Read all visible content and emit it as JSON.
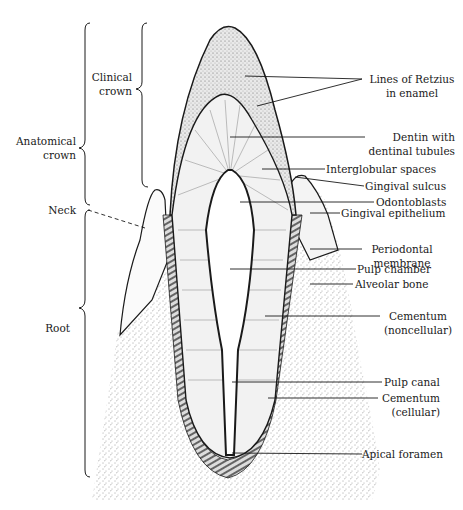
{
  "diagram": {
    "left_labels": {
      "clinical_crown": [
        "Clinical",
        "crown"
      ],
      "anatomical_crown": [
        "Anatomical",
        "crown"
      ],
      "neck": "Neck",
      "root": "Root"
    },
    "right_labels": [
      {
        "id": "lines-of-retzius",
        "lines": [
          "Lines of Retzius",
          "in enamel"
        ]
      },
      {
        "id": "dentin",
        "lines": [
          "Dentin with",
          "dentinal tubules"
        ]
      },
      {
        "id": "interglobular-spaces",
        "lines": [
          "Interglobular spaces"
        ]
      },
      {
        "id": "gingival-sulcus",
        "lines": [
          "Gingival sulcus"
        ]
      },
      {
        "id": "odontoblasts",
        "lines": [
          "Odontoblasts"
        ]
      },
      {
        "id": "gingival-epithelium",
        "lines": [
          "Gingival epithelium"
        ]
      },
      {
        "id": "periodontal-membrane",
        "lines": [
          "Periodontal",
          "membrane"
        ]
      },
      {
        "id": "pulp-chamber",
        "lines": [
          "Pulp chamber"
        ]
      },
      {
        "id": "alveolar-bone",
        "lines": [
          "Alveolar bone"
        ]
      },
      {
        "id": "cementum-noncellular",
        "lines": [
          "Cementum",
          "(noncellular)"
        ]
      },
      {
        "id": "pulp-canal",
        "lines": [
          "Pulp canal"
        ]
      },
      {
        "id": "cementum-cellular",
        "lines": [
          "Cementum",
          "(cellular)"
        ]
      },
      {
        "id": "apical-foramen",
        "lines": [
          "Apical foramen"
        ]
      }
    ],
    "colors": {
      "ink": "#1a1a1a",
      "background": "#ffffff"
    }
  }
}
